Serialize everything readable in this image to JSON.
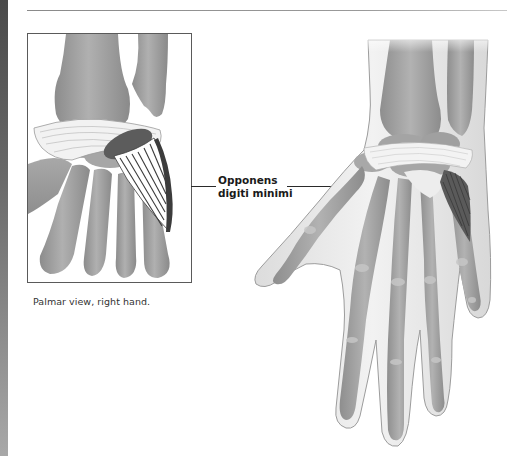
{
  "figure": {
    "inset": {
      "caption": "Palmar view, right hand."
    },
    "label": {
      "line1": "Opponens",
      "line2": "digiti minimi"
    },
    "colors": {
      "bone": "#9a9a9a",
      "bone_light": "#c4c4c4",
      "skin": "#e4e4e4",
      "skin_outline": "#9c9c9c",
      "muscle_dark": "#555555",
      "ligament": "#f4f4f4",
      "side_strip_top": "#4a4a4a",
      "side_strip_bottom": "#a8a8a8"
    }
  }
}
